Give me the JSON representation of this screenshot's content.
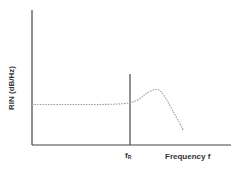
{
  "chart_data": {
    "type": "line",
    "title": "",
    "xlabel": "Frequency f",
    "ylabel": "RIN (dB/Hz)",
    "x_ticks": [
      {
        "label": "f",
        "subscript": "R",
        "position": "resonance"
      }
    ],
    "y_ticks": [],
    "grid": false,
    "legend": null,
    "annotations": [
      {
        "type": "vertical_line",
        "at": "f_R",
        "description": "resonance frequency marker"
      }
    ],
    "series": [
      {
        "name": "RIN spectrum",
        "style": "dotted",
        "color": "#9a9a9a",
        "description": "flat low-frequency plateau rising to a resonance peak at f_R, then rolling off",
        "x_norm": [
          0.0,
          0.2,
          0.4,
          0.5,
          0.55,
          0.58,
          0.63,
          0.66,
          0.72,
          0.76
        ],
        "y_norm": [
          0.3,
          0.3,
          0.3,
          0.31,
          0.35,
          0.39,
          0.42,
          0.38,
          0.22,
          0.11
        ]
      }
    ]
  },
  "labels": {
    "ylabel_text": "RIN (dB/Hz)",
    "xlabel_text": "Frequency f",
    "fr_main": "f",
    "fr_sub": "R"
  },
  "colors": {
    "axis": "#444444",
    "curve": "#9a9a9a",
    "marker_line": "#555555",
    "text": "#333333"
  }
}
